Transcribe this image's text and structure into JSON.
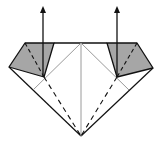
{
  "diagram": {
    "type": "origami-fold-step",
    "colors": {
      "background": "#ffffff",
      "flap_fill": "#a6a6a6",
      "edge": "#111111",
      "crease": "#9a9a9a",
      "valley_fold": "#111111"
    },
    "points": {
      "top_left": [
        25,
        43
      ],
      "top_right": [
        137,
        43
      ],
      "top_center": [
        81,
        43
      ],
      "far_left": [
        9,
        67
      ],
      "far_right": [
        153,
        68
      ],
      "bottom": [
        81,
        136
      ],
      "left_flap_inner": [
        54,
        43
      ],
      "left_flap_point": [
        44,
        77
      ],
      "right_flap_inner": [
        107,
        43
      ],
      "right_flap_point": [
        117,
        77
      ]
    },
    "arrows": [
      {
        "name": "lift-left-flap",
        "x": 43,
        "from_y": 62,
        "to_y": 7
      },
      {
        "name": "lift-right-flap",
        "x": 117,
        "from_y": 62,
        "to_y": 7
      }
    ]
  }
}
